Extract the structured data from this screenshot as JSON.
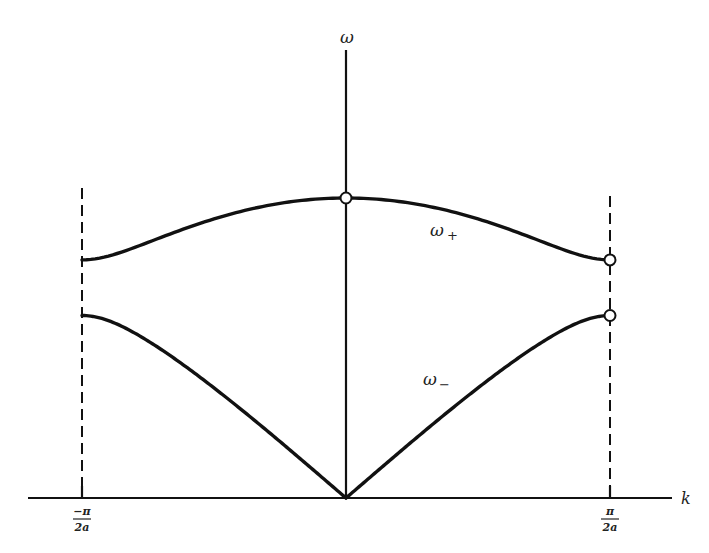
{
  "chart_data": {
    "type": "line",
    "title": "",
    "xlabel": "k",
    "ylabel": "ω",
    "xlim": [
      -1,
      1
    ],
    "x_units": "π/2a",
    "ylim": [
      0,
      1
    ],
    "grid": false,
    "tick_labels": {
      "left": {
        "num": "−π",
        "den": "2a"
      },
      "right": {
        "num": "π",
        "den": "2a"
      }
    },
    "model": {
      "description": "diatomic chain dispersion, ω² = ½[1 ± √(1 − 4·p·(1−p)·sin²(kπ/2))]",
      "p_optical_boundary_sq": 0.63
    },
    "series": [
      {
        "name": "optical",
        "label": "ω",
        "label_sub": "+",
        "branch": "plus",
        "values_at": {
          "k=-1": 0.79,
          "k=0": 1.0,
          "k=1": 0.79
        }
      },
      {
        "name": "acoustic",
        "label": "ω",
        "label_sub": "−",
        "branch": "minus",
        "values_at": {
          "k=-1": 0.61,
          "k=0": 0.0,
          "k=1": 0.61
        }
      }
    ],
    "markers": [
      {
        "k": 0,
        "branch": "plus"
      },
      {
        "k": 1,
        "branch": "plus"
      },
      {
        "k": 1,
        "branch": "minus"
      }
    ],
    "zone_boundaries": [
      -1,
      1
    ]
  }
}
